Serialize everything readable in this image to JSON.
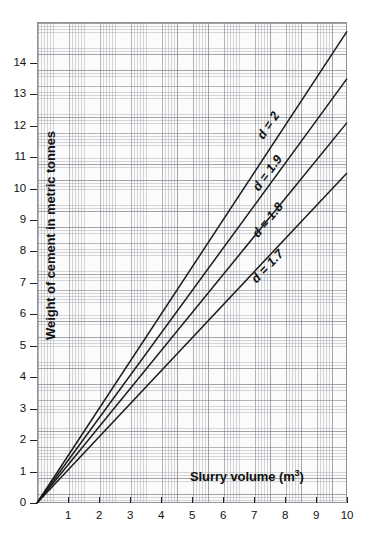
{
  "chart_data": {
    "type": "line",
    "title": "",
    "xlabel": "Slurry volume (m3)",
    "xlabel_base": "Slurry volume (m",
    "xlabel_sup": "3",
    "xlabel_tail": ")",
    "ylabel": "Weight of cement in metric tonnes",
    "xlim": [
      0,
      10
    ],
    "ylim": [
      0,
      15.3
    ],
    "xticks": [
      0,
      1,
      2,
      3,
      4,
      5,
      6,
      7,
      8,
      9,
      10
    ],
    "xtick_labels": [
      "0",
      "1",
      "2",
      "3",
      "4",
      "5",
      "6",
      "7",
      "8",
      "9",
      "10"
    ],
    "yticks": [
      0,
      1,
      2,
      3,
      4,
      5,
      6,
      7,
      8,
      9,
      10,
      11,
      12,
      13,
      14
    ],
    "ytick_labels": [
      "0",
      "1",
      "2",
      "3",
      "4",
      "5",
      "6",
      "7",
      "8",
      "9",
      "10",
      "11",
      "12",
      "13",
      "14"
    ],
    "grid": "both-minor-and-major",
    "legend_position": "inline-along-curves",
    "line_color": "#1b1b1b",
    "grid_color": "#8e9195",
    "plot_background": "#fbfbfb",
    "series": [
      {
        "name": "d = 2",
        "label": "d = 2",
        "density": 2.0,
        "x": [
          0,
          10
        ],
        "values": [
          0,
          15.0
        ],
        "slope": 1.5,
        "label_position": {
          "x": 7.55,
          "y": 11.6
        }
      },
      {
        "name": "d = 1.9",
        "label": "d = 1.9",
        "density": 1.9,
        "x": [
          0,
          10
        ],
        "values": [
          0,
          13.5
        ],
        "slope": 1.35,
        "label_position": {
          "x": 7.4,
          "y": 9.95
        }
      },
      {
        "name": "d = 1.8",
        "label": "d = 1.8",
        "density": 1.8,
        "x": [
          0,
          10
        ],
        "values": [
          0,
          12.1
        ],
        "slope": 1.21,
        "label_position": {
          "x": 7.35,
          "y": 8.45
        }
      },
      {
        "name": "d = 1.7",
        "label": "d = 1.7",
        "density": 1.7,
        "x": [
          0,
          10
        ],
        "values": [
          0,
          10.5
        ],
        "slope": 1.05,
        "label_position": {
          "x": 7.3,
          "y": 7.0
        }
      }
    ]
  }
}
